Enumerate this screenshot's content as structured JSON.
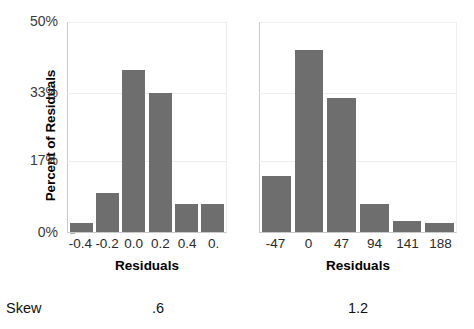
{
  "chart_data": [
    {
      "type": "bar",
      "panel_id": "left",
      "title": "",
      "xlabel": "Residuals",
      "ylabel": "Percent of Residuals",
      "categories": [
        "-0.4",
        "-0.2",
        "0.0",
        "0.2",
        "0.4",
        "0."
      ],
      "values": [
        2.1,
        9.2,
        38.5,
        33.1,
        6.6,
        6.6
      ],
      "ylim": [
        0,
        50
      ],
      "yticks": [
        0,
        17,
        33,
        50
      ],
      "ytick_labels": [
        "0%",
        "17%",
        "33%",
        "50%"
      ],
      "grid": true,
      "legend": "none",
      "bar_color": "#6e6e6e",
      "skew": ".6"
    },
    {
      "type": "bar",
      "panel_id": "right",
      "title": "",
      "xlabel": "Residuals",
      "ylabel": "Percent of Residuals",
      "categories": [
        "-47",
        "0",
        "47",
        "94",
        "141",
        "188"
      ],
      "values": [
        13.3,
        43.4,
        31.8,
        6.6,
        2.6,
        2.1
      ],
      "ylim": [
        0,
        50
      ],
      "yticks": [
        0,
        17,
        33,
        50
      ],
      "ytick_labels": [
        "0%",
        "17%",
        "33%",
        "50%"
      ],
      "grid": true,
      "legend": "none",
      "bar_color": "#6e6e6e",
      "skew": "1.2"
    }
  ],
  "axis": {
    "y_title": "Percent of Residuals",
    "y_ticks": [
      {
        "label": "50%",
        "value": 50
      },
      {
        "label": "33%",
        "value": 33
      },
      {
        "label": "17%",
        "value": 17
      },
      {
        "label": "0%",
        "value": 0
      }
    ]
  },
  "left_panel": {
    "x_title": "Residuals",
    "x_ticks": [
      "-0.4",
      "-0.2",
      "0.0",
      "0.2",
      "0.4",
      "0."
    ],
    "bars": [
      {
        "category": "-0.4",
        "value": 2.1
      },
      {
        "category": "-0.2",
        "value": 9.2
      },
      {
        "category": "0.0",
        "value": 38.5
      },
      {
        "category": "0.2",
        "value": 33.1
      },
      {
        "category": "0.4",
        "value": 6.6
      },
      {
        "category": "0.",
        "value": 6.6
      }
    ]
  },
  "right_panel": {
    "x_title": "Residuals",
    "x_ticks": [
      "-47",
      "0",
      "47",
      "94",
      "141",
      "188"
    ],
    "bars": [
      {
        "category": "-47",
        "value": 13.3
      },
      {
        "category": "0",
        "value": 43.4
      },
      {
        "category": "47",
        "value": 31.8
      },
      {
        "category": "94",
        "value": 6.6
      },
      {
        "category": "141",
        "value": 2.6
      },
      {
        "category": "188",
        "value": 2.1
      }
    ]
  },
  "stats": {
    "row_label": "Skew",
    "left_value": ".6",
    "right_value": "1.2"
  },
  "colors": {
    "bar_fill": "#6e6e6e",
    "gridline": "#ededed",
    "axis_line": "#c9c9c9",
    "text": "#111111"
  }
}
